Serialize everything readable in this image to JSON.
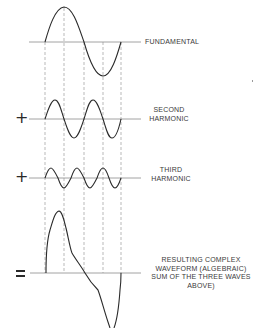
{
  "diagram": {
    "type": "waveform-synthesis",
    "colors": {
      "wave": "#2a2a2a",
      "axis": "#8a8a8a",
      "guide": "#8a8a8a",
      "text": "#3a3a3a"
    },
    "guide_lines_x": [
      45,
      64,
      84,
      103,
      121
    ],
    "rows": [
      {
        "id": "fundamental",
        "operator": "",
        "label_lines": [
          "FUNDAMENTAL"
        ],
        "harmonic": 1,
        "baseline_y": 42,
        "amplitude": 35
      },
      {
        "id": "second-harmonic",
        "operator": "+",
        "label_lines": [
          "SECOND",
          "HARMONIC"
        ],
        "harmonic": 2,
        "baseline_y": 119,
        "amplitude": 19
      },
      {
        "id": "third-harmonic",
        "operator": "+",
        "label_lines": [
          "THIRD",
          "HARMONIC"
        ],
        "harmonic": 3,
        "baseline_y": 178,
        "amplitude": 10
      },
      {
        "id": "resulting-waveform",
        "operator": "=",
        "label_lines": [
          "RESULTING COMPLEX",
          "WAVEFORM (ALGEBRAIC)",
          "SUM OF THE THREE WAVES",
          "ABOVE)"
        ],
        "baseline_y": 273
      }
    ]
  },
  "labels": {
    "fundamental": "FUNDAMENTAL",
    "second_1": "SECOND",
    "second_2": "HARMONIC",
    "third_1": "THIRD",
    "third_2": "HARMONIC",
    "result_1": "RESULTING COMPLEX",
    "result_2": "WAVEFORM (ALGEBRAIC)",
    "result_3": "SUM OF THE THREE WAVES",
    "result_4": "ABOVE)"
  },
  "operators": {
    "plus": "+",
    "equals": "="
  }
}
